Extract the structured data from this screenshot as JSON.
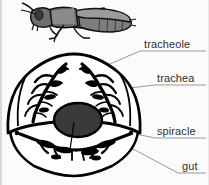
{
  "figure": {
    "title_visible": false,
    "organism_illustration": "grasshopper",
    "background_color": "#fbfbfb",
    "outline_color": "#000000",
    "body_fill_color": "#ffffff",
    "gut_fill_color": "#3a3a3a",
    "trachea_fill_color": "#000000",
    "grasshopper_fill_color": "#808080",
    "leader_line_color": "#8c8c8c",
    "label_text_color": "#2f2f2f"
  },
  "labels": [
    {
      "id": "tracheole",
      "text": "tracheole",
      "x": 144,
      "y": 38,
      "leader_from_x": 142,
      "leader_from_y": 51,
      "leader_to_x": 68,
      "leader_to_y": 82
    },
    {
      "id": "trachea",
      "text": "trachea",
      "x": 157,
      "y": 72,
      "leader_from_x": 155,
      "leader_from_y": 85,
      "leader_to_x": 104,
      "leader_to_y": 91
    },
    {
      "id": "spiracle",
      "text": "spiracle",
      "x": 157,
      "y": 125,
      "leader_from_x": 155,
      "leader_from_y": 138,
      "leader_to_x": 131,
      "leader_to_y": 133
    },
    {
      "id": "gut",
      "text": "gut",
      "x": 182,
      "y": 160,
      "leader_from_x": 180,
      "leader_from_y": 173,
      "leader_to_x": 92,
      "leader_to_y": 127
    }
  ]
}
